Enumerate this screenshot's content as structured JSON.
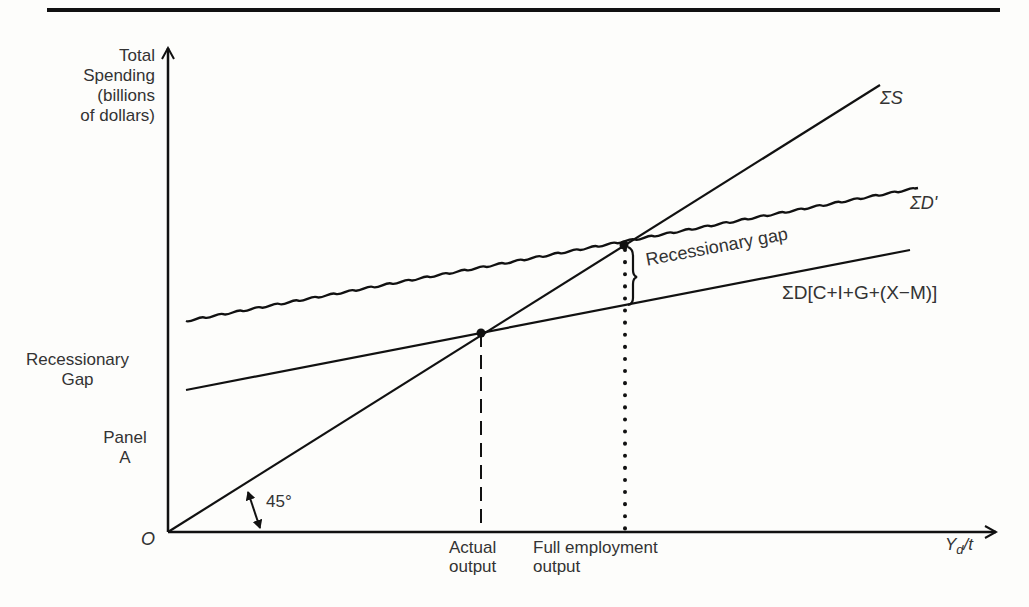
{
  "figure": {
    "y_axis_label": [
      "Total",
      "Spending",
      "(billions",
      "of dollars)"
    ],
    "x_axis_label": "Y_d/t",
    "x_axis_label_main": "Y",
    "x_axis_label_sub": "d",
    "x_axis_label_tail": "/t",
    "origin_label": "O",
    "angle_label": "45°",
    "left_labels": {
      "recessionary_gap": [
        "Recessionary",
        "Gap"
      ],
      "panel": [
        "Panel",
        "A"
      ]
    },
    "x_markers": {
      "actual_output": [
        "Actual",
        "output"
      ],
      "full_employment_output": [
        "Full employment",
        "output"
      ]
    },
    "curves": {
      "aggregate_supply": {
        "label": "ΣS",
        "style": "solid",
        "from": [
          168,
          532
        ],
        "to": [
          880,
          85
        ]
      },
      "aggregate_demand_new": {
        "label": "ΣD'",
        "style": "wavy",
        "from": [
          186,
          321
        ],
        "to": [
          918,
          188
        ]
      },
      "aggregate_demand": {
        "label": "ΣD[C+I+G+(X−M)]",
        "style": "solid",
        "from": [
          186,
          390
        ],
        "to": [
          910,
          250
        ]
      }
    },
    "annotations": {
      "gap_brace_label": "Recessionary gap"
    },
    "points": {
      "actual_equilibrium": [
        481,
        333
      ],
      "full_employment_equilibrium": [
        624,
        245
      ]
    }
  }
}
